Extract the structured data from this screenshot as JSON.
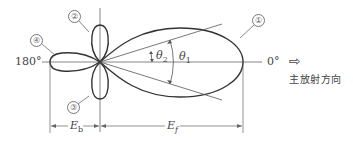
{
  "diagram": {
    "type": "antenna-radiation-pattern",
    "angles": {
      "back": "180°",
      "front": "0°"
    },
    "lobe_markers": {
      "main_lobe": "①",
      "upper_side_lobe": "②",
      "lower_side_lobe": "③",
      "back_lobe": "④"
    },
    "angle_labels": {
      "theta2": "θ2",
      "theta1": "θ1"
    },
    "theta_symbol": "θ",
    "theta2_sub": "2",
    "theta1_sub": "1",
    "dimensions": {
      "back": {
        "symbol": "E",
        "sub": "b"
      },
      "front": {
        "symbol": "E",
        "sub": "f"
      }
    },
    "direction_arrow": "⇨",
    "direction_label": "主放射方向"
  },
  "colors": {
    "stroke": "#333333",
    "thin": "#555555",
    "background": "#ffffff"
  }
}
